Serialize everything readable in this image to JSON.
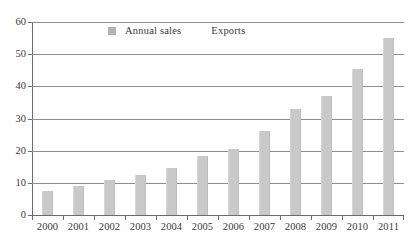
{
  "chart_data": {
    "type": "bar",
    "title": "",
    "subtitle": "",
    "xlabel": "",
    "ylabel": "",
    "categories": [
      "2000",
      "2001",
      "2002",
      "2003",
      "2004",
      "2005",
      "2006",
      "2007",
      "2008",
      "2009",
      "2010",
      "2011"
    ],
    "series": [
      {
        "name": "Annual sales",
        "color": "#c9c9c9",
        "values": [
          7.5,
          9,
          11,
          12.5,
          14.5,
          18.5,
          20.5,
          26,
          33,
          37,
          45.5,
          55
        ]
      }
    ],
    "legend": [
      {
        "label": "Annual sales",
        "swatch": true,
        "color": "#b4b4b4"
      },
      {
        "label": "Exports",
        "swatch": false,
        "color": "#b4b4b4"
      }
    ],
    "legend_position": "top-center",
    "ylim": [
      0,
      60
    ],
    "ytick_values": [
      0,
      10,
      20,
      30,
      40,
      50,
      60
    ],
    "ytick_labels": [
      "0",
      "10",
      "20",
      "30",
      "40",
      "50",
      "60"
    ],
    "grid": true,
    "grid_axis": "y",
    "axis_color": "#6a6a6a",
    "grid_color": "#8d8d8d",
    "text_color": "#3a3a3a",
    "background": "#ffffff"
  }
}
